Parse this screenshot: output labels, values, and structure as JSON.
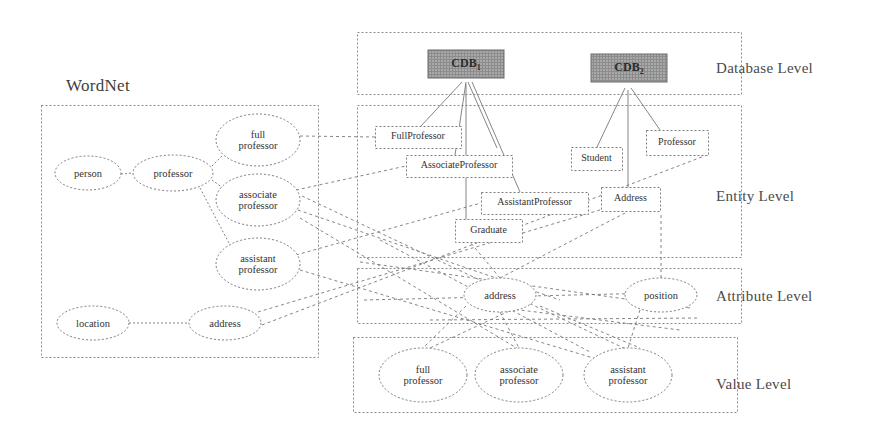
{
  "diagram": {
    "wordnet_label": "WordNet",
    "levels": [
      {
        "id": "database",
        "label": "Database Level",
        "box": [
          357,
          32,
          384,
          62
        ]
      },
      {
        "id": "entity",
        "label": "Entity Level",
        "box": [
          357,
          105,
          384,
          152
        ]
      },
      {
        "id": "attribute",
        "label": "Attribute Level",
        "box": [
          357,
          268,
          384,
          55
        ]
      },
      {
        "id": "value",
        "label": "Value Level",
        "box": [
          353,
          337,
          388,
          75
        ]
      }
    ],
    "level_label_positions": [
      {
        "x": 716,
        "y": 60
      },
      {
        "x": 716,
        "y": 188
      },
      {
        "x": 716,
        "y": 288
      },
      {
        "x": 716,
        "y": 376
      }
    ],
    "wordnet_box": [
      41,
      105,
      277,
      252
    ],
    "database_nodes": [
      {
        "name": "CDB1",
        "text": "CDB",
        "sub": "1",
        "cx": 466,
        "cy": 64,
        "w": 76,
        "h": 28
      },
      {
        "name": "CDB2",
        "text": "CDB",
        "sub": "2",
        "cx": 629,
        "cy": 68,
        "w": 76,
        "h": 28
      }
    ],
    "entity_nodes": [
      {
        "name": "FullProfessor",
        "text": "FullProfessor",
        "x": 375,
        "y": 126,
        "w": 86,
        "h": 22
      },
      {
        "name": "AssociateProfessor",
        "text": "AssociateProfessor",
        "x": 406,
        "y": 155,
        "w": 106,
        "h": 22
      },
      {
        "name": "AssistantProfessor",
        "text": "AssistantProfessor",
        "x": 481,
        "y": 192,
        "w": 107,
        "h": 22
      },
      {
        "name": "Graduate",
        "text": "Graduate",
        "x": 455,
        "y": 219,
        "w": 67,
        "h": 23
      },
      {
        "name": "Student",
        "text": "Student",
        "x": 571,
        "y": 147,
        "w": 51,
        "h": 23
      },
      {
        "name": "Address",
        "text": "Address",
        "x": 601,
        "y": 187,
        "w": 59,
        "h": 24
      },
      {
        "name": "Professor",
        "text": "Professor",
        "x": 646,
        "y": 130,
        "w": 62,
        "h": 25
      }
    ],
    "wordnet_nodes": [
      {
        "name": "person",
        "text": "person",
        "cx": 88,
        "cy": 173,
        "rx": 33,
        "ry": 17
      },
      {
        "name": "professor",
        "text": "professor",
        "cx": 173,
        "cy": 173,
        "rx": 40,
        "ry": 18
      },
      {
        "name": "full-professor",
        "text": "full\nprofessor",
        "cx": 258,
        "cy": 140,
        "rx": 42,
        "ry": 26
      },
      {
        "name": "associate-professor",
        "text": "associate\nprofessor",
        "cx": 258,
        "cy": 200,
        "rx": 42,
        "ry": 26
      },
      {
        "name": "assistant-professor",
        "text": "assistant\nprofessor",
        "cx": 258,
        "cy": 264,
        "rx": 42,
        "ry": 26
      },
      {
        "name": "location",
        "text": "location",
        "cx": 93,
        "cy": 323,
        "rx": 36,
        "ry": 17
      },
      {
        "name": "address",
        "text": "address",
        "cx": 225,
        "cy": 323,
        "rx": 36,
        "ry": 17
      }
    ],
    "attribute_nodes": [
      {
        "name": "address",
        "text": "address",
        "cx": 500,
        "cy": 295,
        "rx": 36,
        "ry": 17
      },
      {
        "name": "position",
        "text": "position",
        "cx": 661,
        "cy": 295,
        "rx": 36,
        "ry": 17
      }
    ],
    "value_nodes": [
      {
        "name": "full-professor",
        "text": "full\nprofessor",
        "cx": 423,
        "cy": 375,
        "rx": 44,
        "ry": 27
      },
      {
        "name": "associate-professor",
        "text": "associate\nprofessor",
        "cx": 519,
        "cy": 375,
        "rx": 44,
        "ry": 27
      },
      {
        "name": "assistant-professor",
        "text": "assistant\nprofessor",
        "cx": 628,
        "cy": 375,
        "rx": 44,
        "ry": 27
      }
    ],
    "edges": {
      "wordnet_internal": [
        [
          121,
          174,
          134,
          173
        ],
        [
          212,
          166,
          222,
          156
        ],
        [
          212,
          180,
          223,
          188
        ],
        [
          200,
          188,
          230,
          245
        ],
        [
          129,
          323,
          189,
          323
        ]
      ],
      "db_to_entity": [
        [
          462,
          82,
          421,
          126
        ],
        [
          466,
          82,
          455,
          155
        ],
        [
          468,
          82,
          497,
          148
        ],
        [
          472,
          82,
          520,
          192
        ],
        [
          466,
          84,
          466,
          240
        ],
        [
          625,
          88,
          597,
          147
        ],
        [
          631,
          88,
          660,
          130
        ],
        [
          628,
          90,
          628,
          198
        ]
      ],
      "wordnet_to_entity": [
        [
          300,
          136,
          375,
          137
        ],
        [
          296,
          190,
          406,
          166
        ],
        [
          296,
          255,
          481,
          203
        ],
        [
          298,
          210,
          560,
          300
        ],
        [
          300,
          270,
          600,
          360
        ],
        [
          258,
          312,
          640,
          198
        ]
      ],
      "entity_to_attribute": [
        [
          500,
          278,
          627,
          212
        ],
        [
          500,
          278,
          470,
          242
        ],
        [
          661,
          278,
          661,
          212
        ],
        [
          520,
          306,
          430,
          348
        ],
        [
          540,
          306,
          640,
          348
        ]
      ],
      "attribute_to_value": [
        [
          466,
          306,
          423,
          348
        ],
        [
          500,
          312,
          519,
          348
        ],
        [
          640,
          310,
          628,
          348
        ],
        [
          480,
          305,
          680,
          330
        ],
        [
          430,
          320,
          700,
          318
        ]
      ],
      "cross_long": [
        [
          262,
          325,
          707,
          155
        ],
        [
          300,
          218,
          520,
          350
        ],
        [
          302,
          196,
          628,
          350
        ],
        [
          360,
          262,
          690,
          308
        ],
        [
          364,
          300,
          700,
          292
        ],
        [
          380,
          240,
          590,
          352
        ]
      ]
    }
  }
}
